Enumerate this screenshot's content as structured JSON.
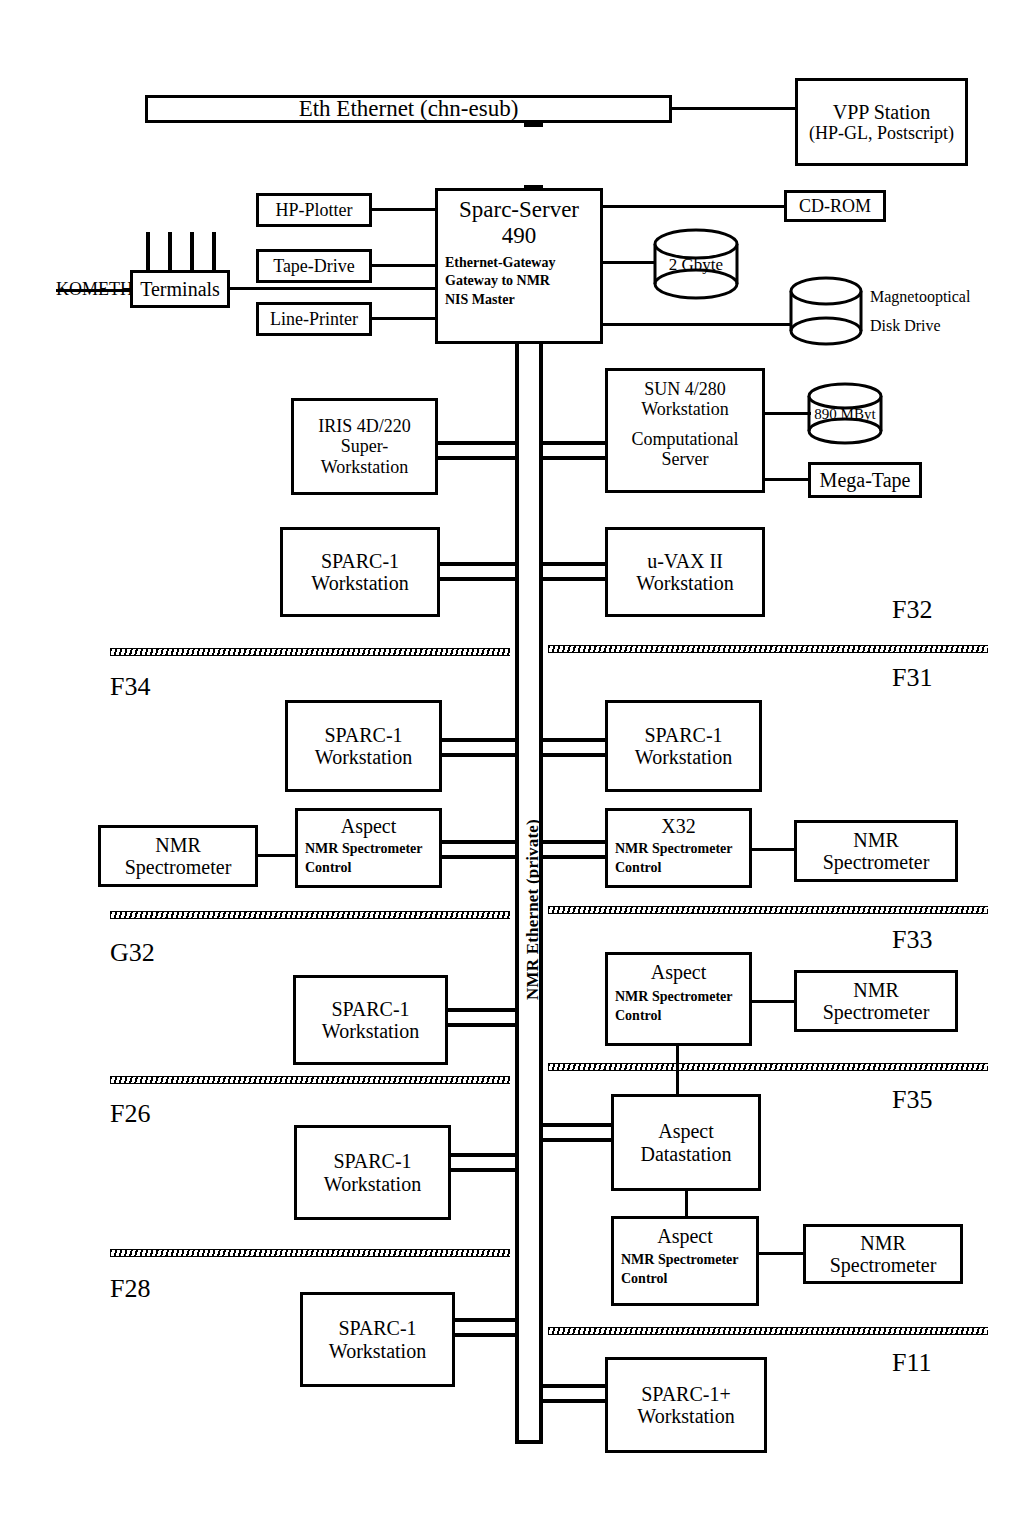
{
  "diagram": {
    "title_bar": {
      "label": "Eth Ethernet (chn-esub)"
    },
    "backbone": {
      "label": "NMR Ethernet (private)"
    },
    "external_label": "KOMETH",
    "nodes": {
      "vpp_station": {
        "line1": "VPP Station",
        "line2": "(HP-GL, Postscript)"
      },
      "cdrom": {
        "line1": "CD-ROM"
      },
      "hp_plotter": {
        "line1": "HP-Plotter"
      },
      "tape_drive": {
        "line1": "Tape-Drive"
      },
      "line_printer": {
        "line1": "Line-Printer"
      },
      "terminals": {
        "line1": "Terminals"
      },
      "sparc_server": {
        "line1": "Sparc-Server",
        "line2": "490",
        "sub1": "Ethernet-Gateway",
        "sub2": "Gateway to NMR",
        "sub3": "NIS Master"
      },
      "disk_2gb": {
        "label": "2 Gbyte"
      },
      "magnetooptical": {
        "line1": "Magnetooptical",
        "line2": "Disk Drive"
      },
      "iris": {
        "line1": "IRIS 4D/220",
        "line2": "Super-",
        "line3": "Workstation"
      },
      "sun4280": {
        "line1": "SUN 4/280",
        "line2": "Workstation",
        "line3": "Computational",
        "line4": "Server"
      },
      "disk_890mb": {
        "label": "890 MByt"
      },
      "mega_tape": {
        "line1": "Mega-Tape"
      },
      "sparc1_f34_top": {
        "line1": "SPARC-1",
        "line2": "Workstation"
      },
      "uvax": {
        "line1": "u-VAX II",
        "line2": "Workstation"
      },
      "sparc1_f34": {
        "line1": "SPARC-1",
        "line2": "Workstation"
      },
      "sparc1_f31": {
        "line1": "SPARC-1",
        "line2": "Workstation"
      },
      "nmr_spec_f34": {
        "line1": "NMR",
        "line2": "Spectrometer"
      },
      "aspect_f34": {
        "title": "Aspect",
        "sub1": "NMR Spectrometer",
        "sub2": "Control"
      },
      "x32_f31": {
        "title": "X32",
        "sub1": "NMR Spectrometer",
        "sub2": "Control"
      },
      "nmr_spec_f31": {
        "line1": "NMR",
        "line2": "Spectrometer"
      },
      "sparc1_g32": {
        "line1": "SPARC-1",
        "line2": "Workstation"
      },
      "aspect_f33": {
        "title": "Aspect",
        "sub1": "NMR Spectrometer",
        "sub2": "Control"
      },
      "nmr_spec_f33": {
        "line1": "NMR",
        "line2": "Spectrometer"
      },
      "sparc1_f26": {
        "line1": "SPARC-1",
        "line2": "Workstation"
      },
      "aspect_datastation": {
        "line1": "Aspect",
        "line2": "Datastation"
      },
      "aspect_f35": {
        "title": "Aspect",
        "sub1": "NMR Spectrometer",
        "sub2": "Control"
      },
      "nmr_spec_f35": {
        "line1": "NMR",
        "line2": "Spectrometer"
      },
      "sparc1_f28": {
        "line1": "SPARC-1",
        "line2": "Workstation"
      },
      "sparc1plus_f11": {
        "line1": "SPARC-1+",
        "line2": "Workstation"
      }
    },
    "zones": {
      "f32": "F32",
      "f34": "F34",
      "f31": "F31",
      "g32": "G32",
      "f33": "F33",
      "f26": "F26",
      "f35": "F35",
      "f28": "F28",
      "f11": "F11"
    }
  }
}
